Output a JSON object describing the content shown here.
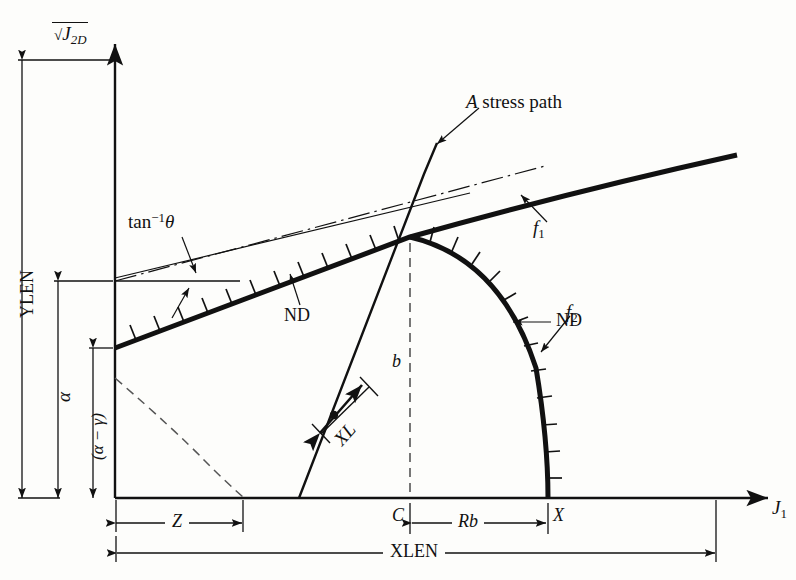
{
  "figure": {
    "kind": "stress-path-yield-surface-diagram",
    "background_color": "#fdfdfb",
    "ink_color": "#111111"
  },
  "axes": {
    "y_axis_label": "J",
    "y_axis_label_sub": "2D",
    "y_axis_label_full": "sqrt(J_2D)",
    "x_axis_label": "J",
    "x_axis_label_sub": "1",
    "origin_px": [
      115,
      498
    ],
    "x_axis_end_px": [
      768,
      498
    ],
    "y_axis_top_px": [
      115,
      42
    ]
  },
  "dimensions": {
    "ylen": "YLEN",
    "alpha": "α",
    "alpha_minus_gamma": "(α − γ)",
    "z": "Z",
    "rb": "Rb",
    "xlen": "XLEN"
  },
  "point_labels": {
    "c": "C",
    "x": "X",
    "b": "b",
    "xl": "XL"
  },
  "curve_labels": {
    "f1": "f",
    "f1_sub": "1",
    "f2": "f",
    "f2_sub": "2",
    "nd_upper": "ND",
    "nd_lower": "ND",
    "stress_path": "stress path",
    "stress_path_point": "A",
    "angle": "tan",
    "angle_sup": "−1",
    "angle_theta": "θ"
  },
  "geometry": {
    "f1_start_px": [
      115,
      348
    ],
    "apex_px": [
      410,
      237
    ],
    "f1_end_px": [
      737,
      155
    ],
    "f2_end_px": [
      548,
      498
    ],
    "stress_path_base_px": [
      299,
      498
    ],
    "stress_path_top_px": [
      437,
      143
    ],
    "xl_point_px": [
      334,
      415
    ],
    "c_tick_px": [
      410,
      498
    ],
    "x_tick_px": [
      548,
      498
    ],
    "z_tick_px": [
      243,
      498
    ],
    "xlen_end_px": [
      716,
      498
    ],
    "arc_end_px": [
      243,
      498
    ],
    "arc_start_px": [
      115,
      378
    ]
  }
}
